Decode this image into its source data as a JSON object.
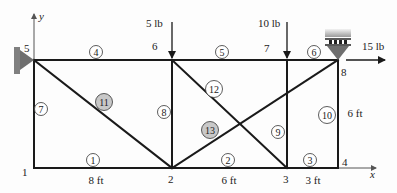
{
  "diagram": {
    "type": "truss",
    "colors": {
      "member": "#1a1a1a",
      "support": "#808080",
      "highlight_circle": "#c8c8c8",
      "axis": "#555555"
    },
    "axes": {
      "x_label": "x",
      "y_label": "y"
    },
    "nodes": [
      {
        "id": "1",
        "label": "1",
        "x": 34,
        "y": 168,
        "lx": 22,
        "ly": 176
      },
      {
        "id": "2",
        "label": "2",
        "x": 172,
        "y": 168,
        "lx": 168,
        "ly": 183
      },
      {
        "id": "3",
        "label": "3",
        "x": 287,
        "y": 168,
        "lx": 283,
        "ly": 183
      },
      {
        "id": "4",
        "label": "4",
        "x": 338,
        "y": 168,
        "lx": 342,
        "ly": 166
      },
      {
        "id": "5",
        "label": "5",
        "x": 34,
        "y": 60,
        "lx": 24,
        "ly": 52
      },
      {
        "id": "6",
        "label": "6",
        "x": 172,
        "y": 60,
        "lx": 152,
        "ly": 50
      },
      {
        "id": "7",
        "label": "7",
        "x": 287,
        "y": 60,
        "lx": 264,
        "ly": 52
      },
      {
        "id": "8",
        "label": "8",
        "x": 338,
        "y": 60,
        "lx": 341,
        "ly": 76
      }
    ],
    "members": [
      {
        "id": "1",
        "label": "1",
        "from": "1",
        "to": "2",
        "cx": 93,
        "cy": 160,
        "shaded": false
      },
      {
        "id": "2",
        "label": "2",
        "from": "2",
        "to": "3",
        "cx": 228,
        "cy": 160,
        "shaded": false
      },
      {
        "id": "3",
        "label": "3",
        "from": "3",
        "to": "4",
        "cx": 310,
        "cy": 160,
        "shaded": false
      },
      {
        "id": "4",
        "label": "4",
        "from": "5",
        "to": "6",
        "cx": 96,
        "cy": 52,
        "shaded": false
      },
      {
        "id": "5",
        "label": "5",
        "from": "6",
        "to": "7",
        "cx": 222,
        "cy": 52,
        "shaded": false
      },
      {
        "id": "6",
        "label": "6",
        "from": "7",
        "to": "8",
        "cx": 314,
        "cy": 52,
        "shaded": false
      },
      {
        "id": "7",
        "label": "7",
        "from": "1",
        "to": "5",
        "cx": 41,
        "cy": 109,
        "shaded": false
      },
      {
        "id": "8",
        "label": "8",
        "from": "2",
        "to": "6",
        "cx": 164,
        "cy": 112,
        "shaded": false
      },
      {
        "id": "9",
        "label": "9",
        "from": "3",
        "to": "7",
        "cx": 278,
        "cy": 132,
        "shaded": false
      },
      {
        "id": "10",
        "label": "10",
        "from": "4",
        "to": "8",
        "cx": 327,
        "cy": 115,
        "shaded": false
      },
      {
        "id": "11",
        "label": "11",
        "from": "5",
        "to": "2",
        "cx": 104,
        "cy": 102,
        "shaded": true
      },
      {
        "id": "12",
        "label": "12",
        "from": "6",
        "to": "3",
        "cx": 214,
        "cy": 89,
        "shaded": false
      },
      {
        "id": "13",
        "label": "13",
        "from": "2",
        "to": "8",
        "cx": 210,
        "cy": 130,
        "shaded": true
      }
    ],
    "dimensions": [
      {
        "label": "8 ft",
        "x": 96,
        "y": 184
      },
      {
        "label": "6 ft",
        "x": 229,
        "y": 184
      },
      {
        "label": "3 ft",
        "x": 313,
        "y": 184
      },
      {
        "label": "6 ft",
        "x": 355,
        "y": 117
      }
    ],
    "loads": [
      {
        "label": "5 lb",
        "node": "6",
        "direction": "down",
        "lx": 146,
        "ly": 27
      },
      {
        "label": "10 lb",
        "node": "7",
        "direction": "down",
        "lx": 258,
        "ly": 27
      },
      {
        "label": "15 lb",
        "node": "8",
        "direction": "right",
        "lx": 362,
        "ly": 50
      }
    ],
    "supports": [
      {
        "type": "pin",
        "node": "5",
        "side": "left"
      },
      {
        "type": "roller",
        "node": "8",
        "side": "top"
      }
    ]
  }
}
